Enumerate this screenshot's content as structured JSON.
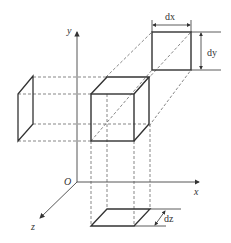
{
  "diagram": {
    "axes": {
      "x_label": "x",
      "y_label": "y",
      "z_label": "z",
      "origin_label": "O"
    },
    "dimensions": {
      "dx_label": "dx",
      "dy_label": "dy",
      "dz_label": "dz"
    },
    "colors": {
      "line": "#333333",
      "dashed": "#555555",
      "background": "#ffffff"
    }
  }
}
